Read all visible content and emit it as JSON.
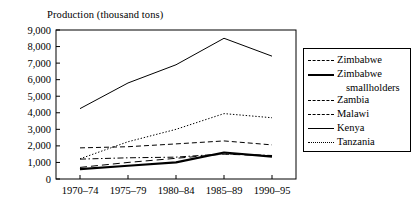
{
  "chart_data": {
    "type": "line",
    "title": "Production (thousand tons)",
    "xlabel": "",
    "ylabel": "",
    "categories": [
      "1970–74",
      "1975–79",
      "1980–84",
      "1985–89",
      "1990–95"
    ],
    "ylim": [
      0,
      9000
    ],
    "ytick_values": [
      0,
      1000,
      2000,
      3000,
      4000,
      5000,
      6000,
      7000,
      8000,
      9000
    ],
    "ytick_labels": [
      "0",
      "1,000",
      "2,000",
      "3,000",
      "4,000",
      "5,000",
      "6,000",
      "7,000",
      "8,000",
      "9,000"
    ],
    "grid": false,
    "legend_position": "right",
    "series": [
      {
        "name": "Zimbabwe",
        "style": "long-dash",
        "width": 1.0,
        "values": [
          700,
          1000,
          1250,
          1500,
          1400
        ]
      },
      {
        "name": "Zimbabwe smallholders",
        "style": "solid",
        "width": 2.2,
        "values": [
          600,
          800,
          1000,
          1600,
          1350
        ]
      },
      {
        "name": "Zambia",
        "style": "dashed",
        "width": 1.0,
        "values": [
          1880,
          1950,
          2120,
          2300,
          2060
        ]
      },
      {
        "name": "Malawi",
        "style": "dash-dot",
        "width": 1.0,
        "values": [
          1200,
          1280,
          1320,
          1520,
          1420
        ]
      },
      {
        "name": "Kenya",
        "style": "solid",
        "width": 1.0,
        "values": [
          4250,
          5800,
          6900,
          8500,
          7420
        ]
      },
      {
        "name": "Tanzania",
        "style": "dotted",
        "width": 1.0,
        "values": [
          1220,
          2250,
          3000,
          3950,
          3700
        ]
      }
    ]
  },
  "legend": {
    "entries": [
      {
        "label": "Zimbabwe",
        "sub": ""
      },
      {
        "label": "Zimbabwe",
        "sub": "smallholders"
      },
      {
        "label": "Zambia",
        "sub": ""
      },
      {
        "label": "Malawi",
        "sub": ""
      },
      {
        "label": "Kenya",
        "sub": ""
      },
      {
        "label": "Tanzania",
        "sub": ""
      }
    ]
  }
}
